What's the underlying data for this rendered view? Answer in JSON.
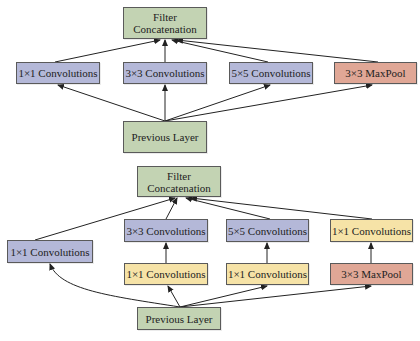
{
  "colors": {
    "green": "#c3d3b3",
    "blue": "#b4b8d8",
    "yellow": "#f6e3a7",
    "red": "#e0a796",
    "edge": "#222222"
  },
  "diagrams": [
    {
      "name": "naive-inception-module",
      "nodes": {
        "filter": {
          "label": "Filter\nConcatenation"
        },
        "conv1": {
          "label": "1×1 Convolutions"
        },
        "conv3": {
          "label": "3×3 Convolutions"
        },
        "conv5": {
          "label": "5×5 Convolutions"
        },
        "pool": {
          "label": "3×3 MaxPool"
        },
        "prev": {
          "label": "Previous Layer"
        }
      },
      "edges": [
        [
          "prev",
          "conv1"
        ],
        [
          "prev",
          "conv3"
        ],
        [
          "prev",
          "conv5"
        ],
        [
          "prev",
          "pool"
        ],
        [
          "conv1",
          "filter"
        ],
        [
          "conv3",
          "filter"
        ],
        [
          "conv5",
          "filter"
        ],
        [
          "pool",
          "filter"
        ]
      ]
    },
    {
      "name": "inception-module-dimension-reduction",
      "nodes": {
        "filter": {
          "label": "Filter\nConcatenation"
        },
        "conv1": {
          "label": "1×1 Convolutions"
        },
        "conv3": {
          "label": "3×3 Convolutions"
        },
        "conv5": {
          "label": "5×5 Convolutions"
        },
        "conv1_after_pool": {
          "label": "1×1 Convolutions"
        },
        "reduce3": {
          "label": "1×1 Convolutions"
        },
        "reduce5": {
          "label": "1×1 Convolutions"
        },
        "pool": {
          "label": "3×3 MaxPool"
        },
        "prev": {
          "label": "Previous Layer"
        }
      },
      "edges": [
        [
          "prev",
          "conv1"
        ],
        [
          "prev",
          "reduce3"
        ],
        [
          "prev",
          "reduce5"
        ],
        [
          "prev",
          "pool"
        ],
        [
          "reduce3",
          "conv3"
        ],
        [
          "reduce5",
          "conv5"
        ],
        [
          "pool",
          "conv1_after_pool"
        ],
        [
          "conv1",
          "filter"
        ],
        [
          "conv3",
          "filter"
        ],
        [
          "conv5",
          "filter"
        ],
        [
          "conv1_after_pool",
          "filter"
        ]
      ]
    }
  ]
}
